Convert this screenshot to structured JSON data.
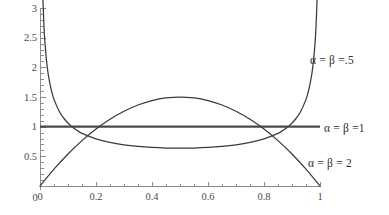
{
  "chart_data": {
    "type": "line",
    "title": "",
    "subtitle": "",
    "xlabel": "",
    "ylabel": "",
    "xlim": [
      0,
      1
    ],
    "ylim": [
      0,
      3
    ],
    "grid": false,
    "legend_position": "right-inline",
    "x_ticks": [
      "0",
      "0.2",
      "0.4",
      "0.6",
      "0.8",
      "1"
    ],
    "x_tick_values": [
      0,
      0.2,
      0.4,
      0.6,
      0.8,
      1
    ],
    "x_minor_tick_values": [
      0.05,
      0.1,
      0.15,
      0.25,
      0.3,
      0.35,
      0.45,
      0.5,
      0.55,
      0.65,
      0.7,
      0.75,
      0.85,
      0.9,
      0.95
    ],
    "y_ticks": [
      "0",
      "0.5",
      "1",
      "1.5",
      "2",
      "2.5",
      "3"
    ],
    "y_tick_values": [
      0,
      0.5,
      1,
      1.5,
      2,
      2.5,
      3
    ],
    "y_minor_tick_values": [
      0.1,
      0.2,
      0.3,
      0.4,
      0.6,
      0.7,
      0.8,
      0.9,
      1.1,
      1.2,
      1.3,
      1.4,
      1.6,
      1.7,
      1.8,
      1.9,
      2.1,
      2.2,
      2.3,
      2.4,
      2.6,
      2.7,
      2.8,
      2.9
    ],
    "series": [
      {
        "name": "alpha = beta = .5",
        "label": "α = β =.5",
        "alpha": 0.5,
        "beta": 0.5,
        "color": "#3a3a3a",
        "description": "U-shaped Beta(0.5,0.5) density; minimum 0.6366 at x=0.5, diverges at x=0 and x=1",
        "min_value": 0.6366,
        "points": [
          [
            0.01,
            3.2
          ],
          [
            0.015,
            2.608
          ],
          [
            0.02,
            2.274
          ],
          [
            0.025,
            2.039
          ],
          [
            0.03,
            1.865
          ],
          [
            0.04,
            1.624
          ],
          [
            0.05,
            1.46
          ],
          [
            0.07,
            1.247
          ],
          [
            0.09,
            1.112
          ],
          [
            0.11,
            1.016
          ],
          [
            0.13,
            0.9437
          ],
          [
            0.15,
            0.887
          ],
          [
            0.2,
            0.7958
          ],
          [
            0.25,
            0.7351
          ],
          [
            0.3,
            0.6944
          ],
          [
            0.35,
            0.6676
          ],
          [
            0.4,
            0.65
          ],
          [
            0.45,
            0.6398
          ],
          [
            0.5,
            0.6366
          ],
          [
            0.55,
            0.6398
          ],
          [
            0.6,
            0.65
          ],
          [
            0.65,
            0.6676
          ],
          [
            0.7,
            0.6944
          ],
          [
            0.75,
            0.7351
          ],
          [
            0.8,
            0.7958
          ],
          [
            0.85,
            0.887
          ],
          [
            0.87,
            0.9437
          ],
          [
            0.89,
            1.016
          ],
          [
            0.91,
            1.112
          ],
          [
            0.93,
            1.247
          ],
          [
            0.95,
            1.46
          ],
          [
            0.96,
            1.624
          ],
          [
            0.97,
            1.865
          ],
          [
            0.975,
            2.039
          ],
          [
            0.98,
            2.274
          ],
          [
            0.985,
            2.608
          ],
          [
            0.99,
            3.2
          ]
        ]
      },
      {
        "name": "alpha = beta = 1",
        "label": "α = β =1",
        "alpha": 1,
        "beta": 1,
        "color": "#4a4a4a",
        "description": "Uniform Beta(1,1) density; constant value 1 across [0,1]",
        "constant_value": 1,
        "points": [
          [
            0.0,
            1.0
          ],
          [
            1.0,
            1.0
          ]
        ]
      },
      {
        "name": "alpha = beta = 2",
        "label": "α = β = 2",
        "alpha": 2,
        "beta": 2,
        "color": "#3a3a3a",
        "description": "Inverted-parabola Beta(2,2) density; maximum 1.5 at x=0.5, zero at both endpoints",
        "max_value": 1.5,
        "points": [
          [
            0.0,
            0.0
          ],
          [
            0.05,
            0.285
          ],
          [
            0.1,
            0.54
          ],
          [
            0.15,
            0.765
          ],
          [
            0.2,
            0.96
          ],
          [
            0.25,
            1.125
          ],
          [
            0.3,
            1.26
          ],
          [
            0.35,
            1.365
          ],
          [
            0.4,
            1.44
          ],
          [
            0.45,
            1.485
          ],
          [
            0.5,
            1.5
          ],
          [
            0.55,
            1.485
          ],
          [
            0.6,
            1.44
          ],
          [
            0.65,
            1.365
          ],
          [
            0.7,
            1.26
          ],
          [
            0.75,
            1.125
          ],
          [
            0.8,
            0.96
          ],
          [
            0.85,
            0.765
          ],
          [
            0.9,
            0.54
          ],
          [
            0.95,
            0.285
          ],
          [
            1.0,
            0.0
          ]
        ]
      }
    ],
    "annotations": [
      {
        "text": "α = β =.5",
        "x_px": 310,
        "y_px": 54
      },
      {
        "text": "α = β =1",
        "x_px": 324,
        "y_px": 122
      },
      {
        "text": "α = β = 2",
        "x_px": 308,
        "y_px": 157
      }
    ]
  },
  "axes": {
    "origin_px": {
      "x": 40,
      "y": 186
    },
    "x_axis_end_px": 320,
    "y_axis_top_px": 8,
    "axis_color": "#8d8d8d"
  }
}
